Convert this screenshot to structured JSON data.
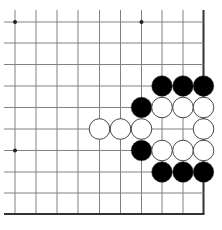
{
  "diagram": {
    "type": "go-board-fragment",
    "corner": "bottom-right",
    "columns": 10,
    "rows": 10,
    "edges": {
      "right": true,
      "bottom": true,
      "top": false,
      "left": false
    },
    "colors": {
      "line": "#808080",
      "edge": "#333333",
      "black_stone": "#000000",
      "white_stone": "#ffffff",
      "stone_outline": "#333333",
      "background": "#ffffff"
    },
    "star_points": [
      {
        "col": 0,
        "row": 0
      },
      {
        "col": 6,
        "row": 0
      },
      {
        "col": 0,
        "row": 6
      }
    ],
    "stones": [
      {
        "col": 7,
        "row": 3,
        "color": "black"
      },
      {
        "col": 8,
        "row": 3,
        "color": "black"
      },
      {
        "col": 9,
        "row": 3,
        "color": "black"
      },
      {
        "col": 6,
        "row": 4,
        "color": "black"
      },
      {
        "col": 7,
        "row": 4,
        "color": "white"
      },
      {
        "col": 8,
        "row": 4,
        "color": "white"
      },
      {
        "col": 9,
        "row": 4,
        "color": "white"
      },
      {
        "col": 4,
        "row": 5,
        "color": "white"
      },
      {
        "col": 5,
        "row": 5,
        "color": "white"
      },
      {
        "col": 6,
        "row": 5,
        "color": "white"
      },
      {
        "col": 9,
        "row": 5,
        "color": "white"
      },
      {
        "col": 6,
        "row": 6,
        "color": "black"
      },
      {
        "col": 7,
        "row": 6,
        "color": "white"
      },
      {
        "col": 8,
        "row": 6,
        "color": "white"
      },
      {
        "col": 9,
        "row": 6,
        "color": "white"
      },
      {
        "col": 7,
        "row": 7,
        "color": "black"
      },
      {
        "col": 8,
        "row": 7,
        "color": "black"
      },
      {
        "col": 9,
        "row": 7,
        "color": "black"
      }
    ]
  }
}
